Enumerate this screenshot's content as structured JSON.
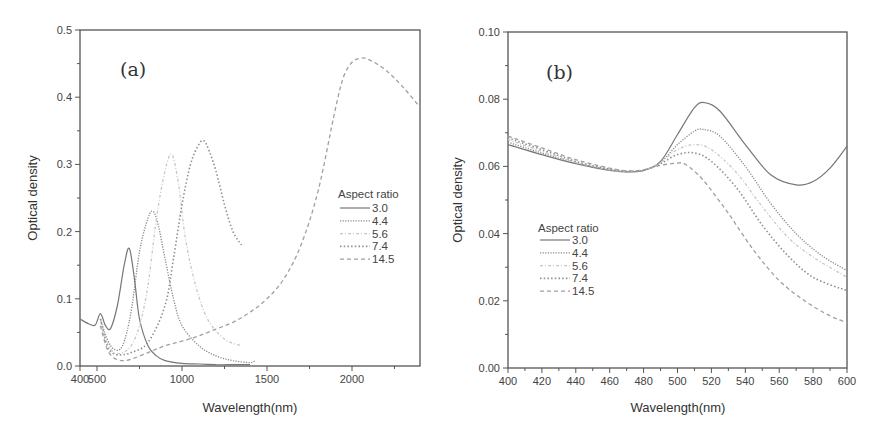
{
  "chart_data": [
    {
      "type": "line",
      "panel": "(a)",
      "title": "",
      "xlabel": "Wavelength(nm)",
      "ylabel": "Optical density",
      "xlim": [
        400,
        2400
      ],
      "ylim": [
        0.0,
        0.5
      ],
      "xticks": [
        400,
        500,
        1000,
        1500,
        2000
      ],
      "xtick_labels": [
        "400",
        "500",
        "1000",
        "1500",
        "2000"
      ],
      "yticks": [
        0.0,
        0.1,
        0.2,
        0.3,
        0.4,
        0.5
      ],
      "ytick_labels": [
        "0.0",
        "0.1",
        "0.2",
        "0.3",
        "0.4",
        "0.5"
      ],
      "grid": false,
      "legend_title": "Aspect ratio",
      "legend_position": "center-right",
      "series": [
        {
          "name": "3.0",
          "style": "solid",
          "color": "#777777",
          "x": [
            400,
            450,
            490,
            520,
            550,
            580,
            620,
            660,
            690,
            720,
            750,
            800,
            850,
            900,
            1000,
            1100,
            1200,
            1300,
            1400
          ],
          "values": [
            0.07,
            0.063,
            0.061,
            0.078,
            0.06,
            0.056,
            0.09,
            0.15,
            0.175,
            0.13,
            0.07,
            0.03,
            0.015,
            0.008,
            0.004,
            0.003,
            0.002,
            0.002,
            0.002
          ]
        },
        {
          "name": "4.4",
          "style": "dotted-fine",
          "color": "#888888",
          "x": [
            520,
            560,
            600,
            650,
            700,
            750,
            800,
            830,
            860,
            900,
            950,
            1000,
            1100,
            1200,
            1300,
            1400,
            1430
          ],
          "values": [
            0.07,
            0.04,
            0.025,
            0.03,
            0.08,
            0.17,
            0.22,
            0.23,
            0.21,
            0.16,
            0.1,
            0.06,
            0.03,
            0.015,
            0.008,
            0.005,
            0.008
          ]
        },
        {
          "name": "5.6",
          "style": "dash-dot-light",
          "color": "#c8c8c8",
          "x": [
            520,
            560,
            600,
            650,
            700,
            750,
            800,
            850,
            900,
            940,
            980,
            1020,
            1080,
            1150,
            1250,
            1350
          ],
          "values": [
            0.07,
            0.035,
            0.02,
            0.02,
            0.03,
            0.06,
            0.12,
            0.22,
            0.29,
            0.315,
            0.27,
            0.19,
            0.12,
            0.07,
            0.04,
            0.03
          ]
        },
        {
          "name": "7.4",
          "style": "dotted",
          "color": "#909090",
          "x": [
            520,
            560,
            600,
            650,
            700,
            800,
            900,
            950,
            1000,
            1050,
            1100,
            1130,
            1160,
            1200,
            1250,
            1300,
            1350
          ],
          "values": [
            0.07,
            0.03,
            0.018,
            0.017,
            0.02,
            0.035,
            0.09,
            0.16,
            0.24,
            0.3,
            0.33,
            0.335,
            0.32,
            0.29,
            0.24,
            0.2,
            0.18
          ]
        },
        {
          "name": "14.5",
          "style": "dashed",
          "color": "#a0a0a0",
          "x": [
            520,
            560,
            600,
            650,
            700,
            800,
            900,
            1000,
            1100,
            1200,
            1300,
            1400,
            1500,
            1600,
            1700,
            1800,
            1900,
            1950,
            2000,
            2050,
            2100,
            2200,
            2300,
            2400
          ],
          "values": [
            0.06,
            0.025,
            0.012,
            0.008,
            0.01,
            0.02,
            0.03,
            0.037,
            0.045,
            0.055,
            0.065,
            0.08,
            0.1,
            0.13,
            0.18,
            0.26,
            0.38,
            0.43,
            0.452,
            0.458,
            0.456,
            0.44,
            0.415,
            0.385
          ]
        }
      ]
    },
    {
      "type": "line",
      "panel": "(b)",
      "title": "",
      "xlabel": "Wavelength(nm)",
      "ylabel": "Optical density",
      "xlim": [
        400,
        600
      ],
      "ylim": [
        0.0,
        0.1
      ],
      "xticks": [
        400,
        420,
        440,
        460,
        480,
        500,
        520,
        540,
        560,
        580,
        600
      ],
      "xtick_labels": [
        "400",
        "420",
        "440",
        "460",
        "480",
        "500",
        "520",
        "540",
        "560",
        "580",
        "600"
      ],
      "yticks": [
        0.0,
        0.02,
        0.04,
        0.06,
        0.08,
        0.1
      ],
      "ytick_labels": [
        "0.00",
        "0.02",
        "0.04",
        "0.06",
        "0.08",
        "0.10"
      ],
      "grid": false,
      "legend_title": "Aspect ratio",
      "legend_position": "lower-left",
      "series": [
        {
          "name": "3.0",
          "style": "solid",
          "color": "#777777",
          "x": [
            400,
            420,
            440,
            460,
            470,
            480,
            490,
            500,
            510,
            516,
            525,
            540,
            555,
            570,
            580,
            590,
            600
          ],
          "values": [
            0.0665,
            0.0635,
            0.0608,
            0.0588,
            0.0584,
            0.0588,
            0.0615,
            0.0695,
            0.0775,
            0.079,
            0.0765,
            0.0665,
            0.0575,
            0.0545,
            0.0555,
            0.0595,
            0.066
          ]
        },
        {
          "name": "4.4",
          "style": "dotted-fine",
          "color": "#888888",
          "x": [
            400,
            420,
            440,
            460,
            470,
            480,
            490,
            500,
            510,
            515,
            525,
            540,
            555,
            570,
            585,
            600
          ],
          "values": [
            0.0672,
            0.064,
            0.061,
            0.059,
            0.0584,
            0.0588,
            0.0612,
            0.0665,
            0.0705,
            0.071,
            0.069,
            0.06,
            0.049,
            0.04,
            0.0335,
            0.029
          ]
        },
        {
          "name": "5.6",
          "style": "dash-dot-light",
          "color": "#c8c8c8",
          "x": [
            400,
            420,
            440,
            460,
            470,
            480,
            490,
            500,
            510,
            520,
            535,
            550,
            565,
            580,
            600
          ],
          "values": [
            0.068,
            0.0645,
            0.0612,
            0.059,
            0.0585,
            0.0588,
            0.0612,
            0.065,
            0.0665,
            0.065,
            0.058,
            0.048,
            0.039,
            0.033,
            0.027
          ]
        },
        {
          "name": "7.4",
          "style": "dotted",
          "color": "#909090",
          "x": [
            400,
            420,
            440,
            460,
            470,
            480,
            490,
            500,
            510,
            520,
            535,
            550,
            565,
            580,
            600
          ],
          "values": [
            0.0685,
            0.065,
            0.0615,
            0.0592,
            0.0586,
            0.0588,
            0.0608,
            0.0635,
            0.064,
            0.0615,
            0.0535,
            0.0425,
            0.0335,
            0.027,
            0.023
          ]
        },
        {
          "name": "14.5",
          "style": "dashed",
          "color": "#a0a0a0",
          "x": [
            400,
            420,
            440,
            460,
            470,
            480,
            490,
            500,
            505,
            515,
            530,
            545,
            560,
            575,
            590,
            600
          ],
          "values": [
            0.069,
            0.0655,
            0.062,
            0.0595,
            0.0587,
            0.059,
            0.0603,
            0.061,
            0.0605,
            0.056,
            0.046,
            0.035,
            0.026,
            0.02,
            0.0155,
            0.0135
          ]
        }
      ]
    }
  ],
  "panels": {
    "a": {
      "label": "(a)",
      "xlabel": "Wavelength(nm)",
      "ylabel": "Optical density",
      "legend_title": "Aspect ratio",
      "legend_items": [
        "3.0",
        "4.4",
        "5.6",
        "7.4",
        "14.5"
      ]
    },
    "b": {
      "label": "(b)",
      "xlabel": "Wavelength(nm)",
      "ylabel": "Optical density",
      "legend_title": "Aspect ratio",
      "legend_items": [
        "3.0",
        "4.4",
        "5.6",
        "7.4",
        "14.5"
      ]
    }
  }
}
